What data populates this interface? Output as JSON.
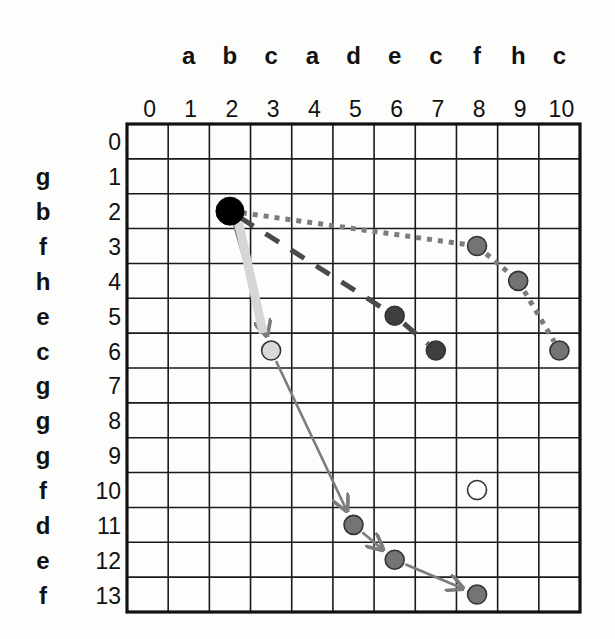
{
  "diagram": {
    "type": "alignment-grid",
    "columns": {
      "indices": [
        "0",
        "1",
        "2",
        "3",
        "4",
        "5",
        "6",
        "7",
        "8",
        "9",
        "10"
      ],
      "sequence": [
        "",
        "a",
        "b",
        "c",
        "a",
        "d",
        "e",
        "c",
        "f",
        "h",
        "c"
      ]
    },
    "rows": {
      "indices": [
        "0",
        "1",
        "2",
        "3",
        "4",
        "5",
        "6",
        "7",
        "8",
        "9",
        "10",
        "11",
        "12",
        "13"
      ],
      "sequence": [
        "",
        "g",
        "b",
        "f",
        "h",
        "e",
        "c",
        "g",
        "g",
        "g",
        "f",
        "d",
        "e",
        "f"
      ]
    },
    "grid": {
      "left": 127,
      "top": 124,
      "right": 580,
      "bottom": 612,
      "cols": 11,
      "rows": 14
    },
    "colors": {
      "grid_line": "#1a1a1a",
      "start_node": "#000000",
      "light_node": "#d9d9d9",
      "medium_node": "#747474",
      "dark_node": "#3e3e3e",
      "hollow_node": "#ffffff",
      "arrow": "#7c7c7c",
      "dotted_path": "#7c7c7c",
      "dashed_path": "#4a4a4a",
      "highlight_band": "#d6d6d6"
    },
    "nodes": [
      {
        "id": "start",
        "col": 2,
        "row": 2,
        "style": "start_node"
      },
      {
        "id": "n-3-6",
        "col": 3,
        "row": 6,
        "style": "light_node"
      },
      {
        "id": "n-6-5",
        "col": 6,
        "row": 5,
        "style": "dark_node"
      },
      {
        "id": "n-7-6",
        "col": 7,
        "row": 6,
        "style": "dark_node"
      },
      {
        "id": "n-8-3",
        "col": 8,
        "row": 3,
        "style": "medium_node"
      },
      {
        "id": "n-9-4",
        "col": 9,
        "row": 4,
        "style": "medium_node"
      },
      {
        "id": "n-10-6",
        "col": 10,
        "row": 6,
        "style": "medium_node"
      },
      {
        "id": "n-8-10",
        "col": 8,
        "row": 10,
        "style": "hollow_node"
      },
      {
        "id": "n-5-11",
        "col": 5,
        "row": 11,
        "style": "medium_node"
      },
      {
        "id": "n-6-12",
        "col": 6,
        "row": 12,
        "style": "medium_node"
      },
      {
        "id": "n-8-13",
        "col": 8,
        "row": 13,
        "style": "medium_node"
      }
    ],
    "paths": [
      {
        "name": "solid-arrow-path",
        "style": "arrow",
        "points": [
          [
            2,
            2
          ],
          [
            3,
            6
          ],
          [
            5,
            11
          ],
          [
            6,
            12
          ],
          [
            8,
            13
          ]
        ]
      },
      {
        "name": "dashed-path",
        "style": "dashed",
        "points": [
          [
            2,
            2
          ],
          [
            6,
            5
          ],
          [
            7,
            6
          ]
        ]
      },
      {
        "name": "dotted-path",
        "style": "dotted",
        "points": [
          [
            2,
            2
          ],
          [
            8,
            3
          ],
          [
            9,
            4
          ],
          [
            10,
            6
          ]
        ]
      },
      {
        "name": "highlight-band",
        "style": "band",
        "points": [
          [
            2,
            2
          ],
          [
            3,
            6
          ]
        ]
      }
    ]
  }
}
